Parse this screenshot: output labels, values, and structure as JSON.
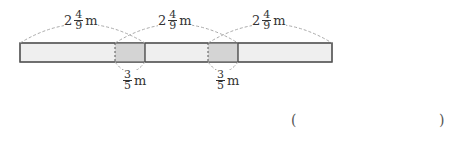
{
  "diagram": {
    "tape_length_label": {
      "whole": "2",
      "num": "4",
      "den": "9",
      "unit": "m"
    },
    "overlap_label": {
      "num": "3",
      "den": "5",
      "unit": "m"
    },
    "tape_count": 3,
    "colors": {
      "tape": "#efefef",
      "overlap": "#d4d4d4",
      "border": "#555555",
      "dash": "#999999"
    }
  },
  "answer": {
    "open": "(",
    "close": ")",
    "value": ""
  }
}
